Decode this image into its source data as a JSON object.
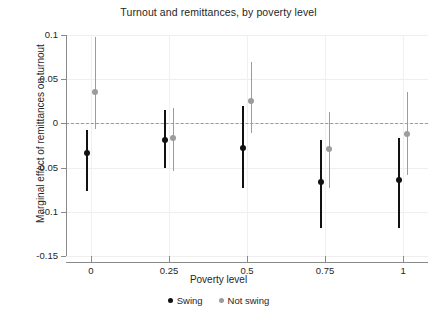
{
  "chart_data": {
    "type": "scatter",
    "title": "Turnout and remittances, by poverty level",
    "xlabel": "Poverty level",
    "ylabel": "Marginal effect of remittances on turnout",
    "xlim": [
      -0.08,
      1.08
    ],
    "ylim": [
      -0.15,
      0.1
    ],
    "xticks": [
      0,
      0.25,
      0.5,
      0.75,
      1
    ],
    "xtick_labels": [
      "0",
      "0.25",
      "0.5",
      "0.75",
      "1"
    ],
    "yticks": [
      0.1,
      0.05,
      0,
      -0.05,
      -0.1,
      -0.15
    ],
    "ytick_labels": [
      "0.1",
      "0.05",
      "0",
      "-0.05",
      "-0.1",
      "-0.15"
    ],
    "grid": "faint both axes",
    "reference_line": {
      "y": 0,
      "style": "dashed",
      "color": "#9a9a9a"
    },
    "legend_position": "below plot, centered",
    "x": [
      0,
      0.25,
      0.5,
      0.75,
      1
    ],
    "series": [
      {
        "name": "Swing",
        "color": "#111111",
        "x_offset": -0.012,
        "values": [
          -0.033,
          -0.019,
          -0.028,
          -0.066,
          -0.064
        ],
        "ci_low": [
          -0.076,
          -0.05,
          -0.073,
          -0.118,
          -0.118
        ],
        "ci_high": [
          -0.008,
          0.015,
          0.02,
          -0.019,
          -0.016
        ]
      },
      {
        "name": "Not swing",
        "color": "#9c9c9c",
        "x_offset": 0.014,
        "values": [
          0.036,
          -0.016,
          0.025,
          -0.029,
          -0.012
        ],
        "ci_low": [
          -0.006,
          -0.054,
          -0.011,
          -0.073,
          -0.058
        ],
        "ci_high": [
          0.098,
          0.017,
          0.069,
          0.013,
          0.035
        ]
      }
    ]
  },
  "legend": {
    "items": [
      {
        "label": "Swing"
      },
      {
        "label": "Not swing"
      }
    ]
  }
}
